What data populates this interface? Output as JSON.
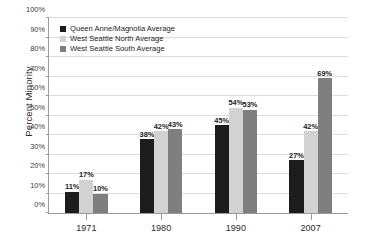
{
  "chart_data": {
    "type": "bar",
    "title": "",
    "xlabel": "",
    "ylabel": "Percent Minority",
    "categories": [
      "1971",
      "1980",
      "1990",
      "2007"
    ],
    "ylim": [
      0,
      100
    ],
    "ytick_labels": [
      "0%",
      "10%",
      "20%",
      "30%",
      "40%",
      "50%",
      "60%",
      "70%",
      "80%",
      "90%",
      "100%"
    ],
    "ytick_values": [
      0,
      10,
      20,
      30,
      40,
      50,
      60,
      70,
      80,
      90,
      100
    ],
    "grid": "horizontal",
    "legend_position": "top-left-inside",
    "value_suffix": "%",
    "series": [
      {
        "name": "Queen Anne/Magnolia Average",
        "color": "#1c1c1c",
        "values": [
          11,
          38,
          45,
          27
        ],
        "labels": [
          "11%",
          "38%",
          "45%",
          "27%"
        ]
      },
      {
        "name": "West Seattle North Average",
        "color": "#d2d2d2",
        "values": [
          17,
          42,
          54,
          42
        ],
        "labels": [
          "17%",
          "42%",
          "54%",
          "42%"
        ]
      },
      {
        "name": "West Seattle South Average",
        "color": "#7f7f7f",
        "values": [
          10,
          43,
          53,
          69
        ],
        "labels": [
          "10%",
          "43%",
          "53%",
          "69%"
        ]
      }
    ]
  }
}
